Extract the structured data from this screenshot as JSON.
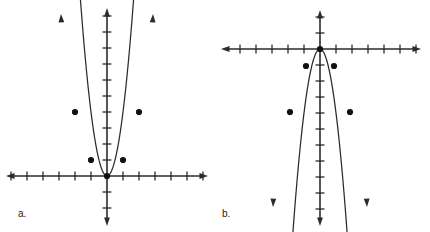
{
  "page": {
    "background_color": "#ffffff",
    "width": 430,
    "height": 232,
    "ink_color": "#2b2b2b",
    "point_color": "#111111"
  },
  "panels": [
    {
      "id": "a",
      "label": "a.",
      "label_position": {
        "x": 18,
        "y": 209
      },
      "chart_data": {
        "type": "scatter",
        "title": "",
        "subtitle": "",
        "xlabel": "",
        "ylabel": "",
        "annotations": [],
        "legend": [],
        "legend_position": "none",
        "grid": false,
        "axes": {
          "origin_px": {
            "x": 107,
            "y": 176
          },
          "unit_px": 16,
          "x_axis_y_px": 176,
          "y_axis_x_px": 107,
          "x_axis_span_px": [
            6,
            208
          ],
          "y_axis_span_px": [
            8,
            226
          ],
          "xlim": [
            -6.3,
            6.3
          ],
          "ylim": [
            -3.1,
            10.5
          ],
          "x_ticks": [
            -6,
            -5,
            -4,
            -3,
            -2,
            -1,
            1,
            2,
            3,
            4,
            5,
            6
          ],
          "y_ticks": [
            -3,
            -2,
            -1,
            1,
            2,
            3,
            4,
            5,
            6,
            7,
            8,
            9,
            10
          ],
          "tick_length_px": 9,
          "arrowheads": [
            "left",
            "right",
            "up",
            "down"
          ]
        },
        "curve": {
          "shape": "parabola",
          "direction": "opens-up",
          "vertex": [
            0,
            0
          ],
          "equation": "y = 4x^2",
          "a_coefficient": 4,
          "arrow_ends": [
            "up-left",
            "up-right"
          ],
          "endpoint_px": [
            [
              61,
              14
            ],
            [
              153,
              14
            ]
          ]
        },
        "points": [
          {
            "x": -2,
            "y": 4,
            "px": [
              75,
              112
            ]
          },
          {
            "x": -1,
            "y": 1,
            "px": [
              91,
              160
            ]
          },
          {
            "x": 0,
            "y": 0,
            "px": [
              107,
              176
            ]
          },
          {
            "x": 1,
            "y": 1,
            "px": [
              123,
              160
            ]
          },
          {
            "x": 2,
            "y": 4,
            "px": [
              139,
              112
            ]
          }
        ],
        "point_radius_px": 3.1
      }
    },
    {
      "id": "b",
      "label": "b.",
      "label_position": {
        "x": 222,
        "y": 209
      },
      "chart_data": {
        "type": "scatter",
        "title": "",
        "subtitle": "",
        "xlabel": "",
        "ylabel": "",
        "annotations": [],
        "legend": [],
        "legend_position": "none",
        "grid": false,
        "axes": {
          "origin_px": {
            "x": 320,
            "y": 49
          },
          "unit_px": 16,
          "x_axis_y_px": 49,
          "y_axis_x_px": 320,
          "x_axis_span_px": [
            221,
            421
          ],
          "y_axis_span_px": [
            10,
            226
          ],
          "xlim": [
            -6.2,
            6.3
          ],
          "ylim": [
            -11.1,
            2.4
          ],
          "x_ticks": [
            -6,
            -5,
            -4,
            -3,
            -2,
            -1,
            1,
            2,
            3,
            4,
            5,
            6
          ],
          "y_ticks": [
            -11,
            -10,
            -9,
            -8,
            -7,
            -6,
            -5,
            -4,
            -3,
            -2,
            -1,
            1,
            2
          ],
          "tick_length_px": 9,
          "arrowheads": [
            "left",
            "right",
            "up",
            "down"
          ]
        },
        "curve": {
          "shape": "parabola",
          "direction": "opens-down",
          "vertex": [
            0,
            0
          ],
          "equation": "y = -4x^2",
          "a_coefficient": -4,
          "arrow_ends": [
            "down-left",
            "down-right"
          ],
          "endpoint_px": [
            [
              273,
              207
            ],
            [
              367,
              207
            ]
          ]
        },
        "points": [
          {
            "x": -2,
            "y": -4,
            "px": [
              290,
              112
            ]
          },
          {
            "x": -1,
            "y": -1,
            "px": [
              306,
              66
            ]
          },
          {
            "x": 0,
            "y": 0,
            "px": [
              320,
              49
            ]
          },
          {
            "x": 1,
            "y": -1,
            "px": [
              334,
              66
            ]
          },
          {
            "x": 2,
            "y": -4,
            "px": [
              350,
              112
            ]
          }
        ],
        "point_radius_px": 3.1
      }
    }
  ]
}
